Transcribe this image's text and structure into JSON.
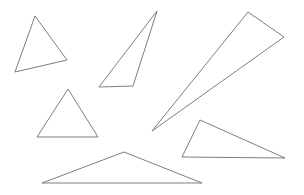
{
  "figure": {
    "title": "",
    "background_color": "#ffffff",
    "stroke_color": "#6f6f6f",
    "stroke_width": 0.9,
    "fill": "none",
    "width": 304,
    "height": 195,
    "shape_count": 6,
    "shape_type": "triangle"
  },
  "shapes": [
    {
      "name": "triangle-top-left",
      "label": "Triangle 1",
      "points": "35,16 15,72 67,60",
      "vertices": [
        [
          35,
          16
        ],
        [
          15,
          72
        ],
        [
          67,
          60
        ]
      ]
    },
    {
      "name": "triangle-top-middle-thin",
      "label": "Triangle 2",
      "points": "157,11 99,87 133,86",
      "vertices": [
        [
          157,
          11
        ],
        [
          99,
          87
        ],
        [
          133,
          86
        ]
      ]
    },
    {
      "name": "triangle-sliver-diagonal",
      "label": "Triangle 3",
      "points": "248,12 284,37 152,131",
      "vertices": [
        [
          248,
          12
        ],
        [
          284,
          37
        ],
        [
          152,
          131
        ]
      ]
    },
    {
      "name": "triangle-left-middle",
      "label": "Triangle 4",
      "points": "68,89 37,137 98,137",
      "vertices": [
        [
          68,
          89
        ],
        [
          37,
          137
        ],
        [
          98,
          137
        ]
      ]
    },
    {
      "name": "triangle-right-lower",
      "label": "Triangle 5",
      "points": "200,120 182,157 285,158",
      "vertices": [
        [
          200,
          120
        ],
        [
          182,
          157
        ],
        [
          285,
          158
        ]
      ]
    },
    {
      "name": "triangle-bottom-center",
      "label": "Triangle 6",
      "points": "124,152 42,183 202,183",
      "vertices": [
        [
          124,
          152
        ],
        [
          42,
          183
        ],
        [
          202,
          183
        ]
      ]
    }
  ]
}
